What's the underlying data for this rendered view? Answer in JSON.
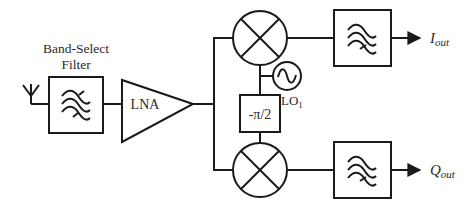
{
  "diagram": {
    "colors": {
      "stroke": "#1a1a1a",
      "text": "#2a2a2a",
      "background": "#ffffff"
    },
    "blocks": {
      "antenna": {
        "icon": "antenna-icon"
      },
      "band_select_filter": {
        "label_line1": "Band-Select",
        "label_line2": "Filter",
        "icon": "bandpass-filter-icon"
      },
      "lna": {
        "label": "LNA"
      },
      "mixer_i": {
        "icon": "mixer-icon"
      },
      "mixer_q": {
        "icon": "mixer-icon"
      },
      "local_oscillator": {
        "label_main": "LO",
        "label_sub": "1",
        "icon": "sine-source-icon"
      },
      "phase_shifter": {
        "label": "-π/2"
      },
      "lpf_i": {
        "icon": "lowpass-filter-icon"
      },
      "lpf_q": {
        "icon": "lowpass-filter-icon"
      }
    },
    "outputs": {
      "i": {
        "main": "I",
        "sub": "out"
      },
      "q": {
        "main": "Q",
        "sub": "out"
      }
    }
  }
}
